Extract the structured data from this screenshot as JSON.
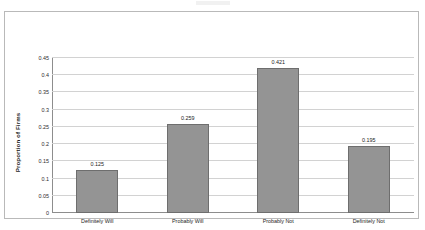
{
  "chart_data": {
    "type": "bar",
    "title": "",
    "xlabel": "",
    "ylabel": "Proportion of Firms",
    "categories": [
      "Definitely Will",
      "Probably Will",
      "Probably Not",
      "Definitely Not"
    ],
    "values": [
      0.125,
      0.259,
      0.421,
      0.195
    ],
    "value_labels": [
      "0.125",
      "0.259",
      "0.421",
      "0.195"
    ],
    "ylim": [
      0,
      0.45
    ],
    "ytick_values": [
      0.45,
      0.4,
      0.35,
      0.3,
      0.25,
      0.2,
      0.15,
      0.1,
      0.05,
      0
    ],
    "ytick_labels": [
      "0.45",
      "0.4",
      "0.35",
      "0.3",
      "0.25",
      "0.2",
      "0.15",
      "0.1",
      "0.05",
      "0"
    ],
    "grid": "horizontal",
    "legend": "none",
    "series_color": "#949494",
    "gridline_color": "#d2d2d2",
    "axis_color": "#8d8d8d"
  }
}
